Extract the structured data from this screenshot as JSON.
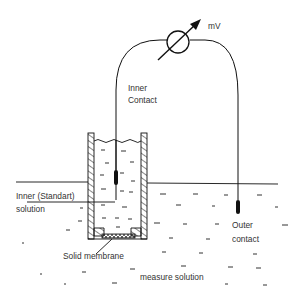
{
  "diagram": {
    "labels": {
      "meter_unit": "mV",
      "inner_contact_line1": "Inner",
      "inner_contact_line2": "Contact",
      "inner_solution_line1": "Inner (Standart)",
      "inner_solution_line2": "solution",
      "outer_contact_line1": "Outer",
      "outer_contact_line2": "contact",
      "membrane": "Solid membrane",
      "measure_solution": "measure solution"
    },
    "components": [
      "voltmeter",
      "inner-contact-electrode",
      "outer-contact-electrode",
      "electrode-body",
      "inner-standard-solution",
      "solid-membrane",
      "measure-solution"
    ],
    "colors": {
      "line": "#111111",
      "text": "#333333",
      "background": "#ffffff"
    }
  }
}
